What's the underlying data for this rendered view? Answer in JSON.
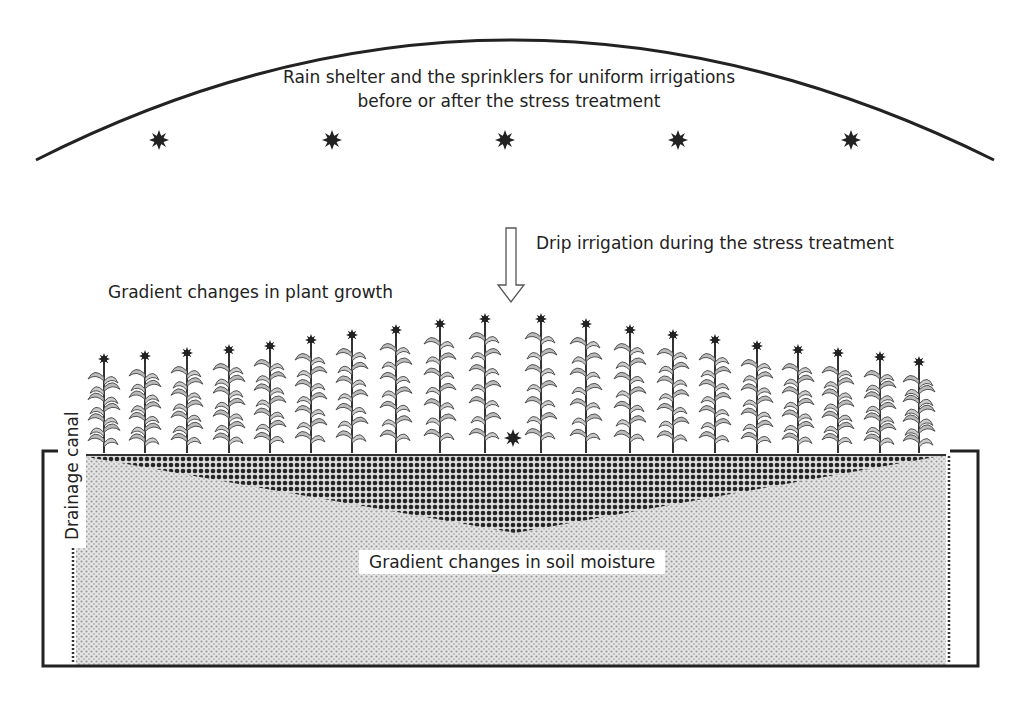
{
  "diagram": {
    "shelter_label_line1": "Rain shelter and the sprinklers for uniform irrigations",
    "shelter_label_line2": "before or after the stress treatment",
    "drip_label": "Drip irrigation during the stress treatment",
    "plant_growth_label": "Gradient changes in plant growth",
    "soil_moisture_label": "Gradient changes in soil moisture",
    "drainage_label": "Drainage canal",
    "sprinkler_count": 5,
    "plant_count": 20,
    "plant_heights_px": [
      98,
      101,
      104,
      107,
      111,
      117,
      122,
      127,
      133,
      138,
      138,
      133,
      127,
      122,
      117,
      111,
      107,
      104,
      100,
      95
    ],
    "colors": {
      "line": "#222222",
      "wet_soil": "#333333",
      "dry_soil": "#d4d4d4",
      "background": "#ffffff"
    }
  }
}
